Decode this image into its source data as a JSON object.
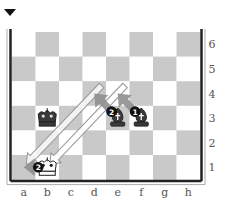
{
  "diagram": {
    "side_to_move": "black",
    "turn_indicator_icon": "black-triangle-down-icon",
    "files": [
      "a",
      "b",
      "c",
      "d",
      "e",
      "f",
      "g",
      "h"
    ],
    "ranks": [
      "6",
      "5",
      "4",
      "3",
      "2",
      "1"
    ],
    "colors": {
      "light_square": "#ffffff",
      "dark_square": "#c9c9c9",
      "border": "#222222",
      "move_arrow": "#8f8f8f",
      "hollow_arrow_stroke": "#9a9a9a",
      "badge": "#111111"
    },
    "pieces": [
      {
        "square": "b3",
        "piece": "king",
        "color": "black"
      },
      {
        "square": "e3",
        "piece": "bishop",
        "color": "black"
      },
      {
        "square": "f3",
        "piece": "bishop",
        "color": "black"
      },
      {
        "square": "b1",
        "piece": "king",
        "color": "white"
      }
    ],
    "move_arrows": [
      {
        "from": "f3",
        "to": "e4",
        "style": "solid",
        "badge": "1"
      },
      {
        "from": "e3",
        "to": "d4",
        "style": "solid",
        "badge": "2"
      },
      {
        "from": "b1",
        "to": "a1",
        "style": "solid",
        "badge": "2"
      }
    ],
    "threat_arrows": [
      {
        "from": "d4",
        "to": "a1",
        "style": "hollow"
      },
      {
        "from": "e4",
        "to": "b1",
        "style": "hollow"
      }
    ]
  }
}
